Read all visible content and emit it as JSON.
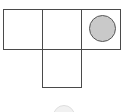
{
  "diagram": {
    "type": "grid-diagram",
    "background_color": "#ffffff",
    "canvas": {
      "width": 127,
      "height": 112
    },
    "style": {
      "cell_fill": "#ffffff",
      "cell_stroke": "#4a4a4a",
      "cell_stroke_width": 1.4,
      "token_fill": "#c9c9c9",
      "token_stroke": "#565656",
      "partial_token_fill": "#ededed",
      "partial_token_stroke": "#d2d2d2"
    },
    "shape_layout": "inverted-T",
    "rows": [
      {
        "row_index": 0,
        "cells": [
          {
            "id": "r0c0",
            "column": 0,
            "label": "",
            "contains_token": false
          },
          {
            "id": "r0c1",
            "column": 1,
            "label": "",
            "contains_token": false
          },
          {
            "id": "r0c2",
            "column": 2,
            "label": "",
            "contains_token": true
          }
        ]
      },
      {
        "row_index": 1,
        "cells": [
          {
            "id": "r1c1",
            "column": 1,
            "label": "",
            "contains_token": false
          }
        ]
      }
    ],
    "tokens": [
      {
        "id": "token-main",
        "shape": "circle",
        "cell": "r0c2",
        "fill": "#c9c9c9",
        "stroke": "#565656",
        "diameter": 27,
        "clipped": false
      },
      {
        "id": "token-partial",
        "shape": "circle",
        "cell": "",
        "fill": "#ededed",
        "stroke": "#d2d2d2",
        "diameter": 22,
        "clipped": true
      }
    ]
  }
}
